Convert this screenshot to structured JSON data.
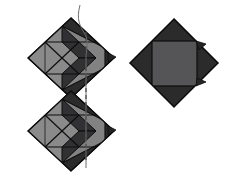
{
  "figure": {
    "title": "Two geometric diamond constructions",
    "background_color": "#ffffff",
    "width": 225,
    "height": 189,
    "palette": {
      "dark_face": "#2b2b2c",
      "dark_face_alt": "#313133",
      "light_face": "#8a8a8a",
      "light_face_alt": "#828283",
      "mid_face": "#555557",
      "outline": "#0d0d0d",
      "dashed_line": "#4a4a4a",
      "thin_curve": "#6f6f6f"
    },
    "left_figure": {
      "name": "stacked-double-diamond",
      "label": "left",
      "unit_count": 2,
      "center_x": 71,
      "units": [
        {
          "name": "upper-unit",
          "diamond_center": [
            71,
            58
          ],
          "diamond_half_width": 43,
          "diamond_half_height": 40,
          "light_square_center": [
            62,
            60
          ],
          "light_square_half": 34
        },
        {
          "name": "lower-unit",
          "diamond_center": [
            71,
            131
          ],
          "diamond_half_width": 43,
          "diamond_half_height": 40,
          "light_square_center": [
            62,
            133
          ],
          "light_square_half": 34
        }
      ],
      "dashed_axis": {
        "name": "fold-axis",
        "x": 86,
        "y_top": 32,
        "y_bottom": 160,
        "dash_pattern": "4 3"
      },
      "thin_curve": {
        "name": "thread-curve",
        "start": [
          80,
          5
        ],
        "end": [
          87,
          170
        ]
      }
    },
    "right_figure": {
      "name": "single-diamond-with-square",
      "label": "right",
      "diamond_center": [
        174,
        63
      ],
      "diamond_half_width": 44,
      "diamond_half_height": 44,
      "inner_square": {
        "name": "inner-gray-square",
        "x": 152,
        "y": 41,
        "size": 45
      },
      "tabs": [
        {
          "name": "tab-right-upper",
          "x": 215,
          "y": 45
        },
        {
          "name": "tab-right-lower",
          "x": 215,
          "y": 82
        }
      ]
    }
  }
}
